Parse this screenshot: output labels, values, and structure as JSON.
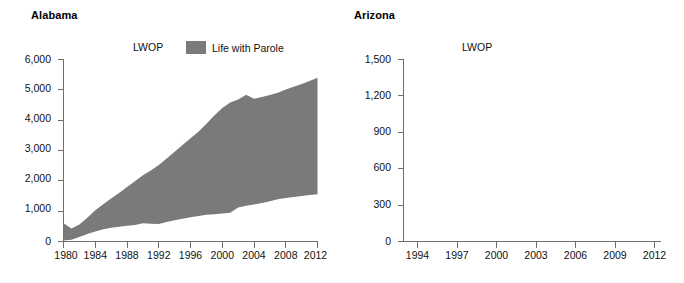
{
  "figure": {
    "background_color": "#ffffff",
    "series_color": "#7a7a7a",
    "axis_color": "#6d6d6d"
  },
  "panels": [
    {
      "id": "alabama",
      "title": "Alabama",
      "inline_label": "LWOP",
      "legend": {
        "swatch_color": "#7a7a7a",
        "label": "Life with Parole"
      }
    },
    {
      "id": "arizona",
      "title": "Arizona",
      "inline_label": "LWOP",
      "legend": null
    }
  ],
  "chart_data": [
    {
      "type": "area",
      "panel": "Alabama",
      "title": "Alabama",
      "xlabel": "",
      "ylabel": "",
      "xlim": [
        1980,
        2012
      ],
      "ylim": [
        0,
        6000
      ],
      "grid": false,
      "legend_position": "top-center",
      "annotations": [
        "LWOP"
      ],
      "ytick_labels": [
        "0",
        "1,000",
        "2,000",
        "3,000",
        "4,000",
        "5,000",
        "6,000"
      ],
      "ytick_values": [
        0,
        1000,
        2000,
        3000,
        4000,
        5000,
        6000
      ],
      "xtick_labels": [
        "1980",
        "1984",
        "1988",
        "1992",
        "1996",
        "2000",
        "2004",
        "2008",
        "2012"
      ],
      "xtick_values": [
        1980,
        1984,
        1988,
        1992,
        1996,
        2000,
        2004,
        2008,
        2012
      ],
      "x": [
        1980,
        1981,
        1982,
        1983,
        1984,
        1985,
        1986,
        1987,
        1988,
        1989,
        1990,
        1991,
        1992,
        1993,
        1994,
        1995,
        1996,
        1997,
        1998,
        1999,
        2000,
        2001,
        2002,
        2003,
        2004,
        2005,
        2006,
        2007,
        2008,
        2009,
        2010,
        2011,
        2012
      ],
      "series": [
        {
          "name": "LWOP",
          "role": "lower_boundary",
          "values": [
            30,
            60,
            150,
            250,
            330,
            400,
            450,
            490,
            520,
            545,
            600,
            585,
            580,
            640,
            700,
            750,
            800,
            840,
            880,
            900,
            920,
            945,
            1120,
            1180,
            1220,
            1270,
            1330,
            1390,
            1430,
            1470,
            1500,
            1530,
            1560
          ]
        },
        {
          "name": "Life with Parole",
          "role": "upper_boundary",
          "values": [
            600,
            430,
            560,
            780,
            1030,
            1230,
            1420,
            1600,
            1800,
            1990,
            2180,
            2340,
            2520,
            2740,
            2960,
            3180,
            3400,
            3620,
            3880,
            4150,
            4400,
            4580,
            4680,
            4840,
            4710,
            4760,
            4830,
            4900,
            5010,
            5100,
            5190,
            5290,
            5400
          ]
        }
      ],
      "notes": "Stacked band: lower boundary is LWOP count, upper boundary is cumulative total including Life with Parole."
    },
    {
      "type": "area",
      "panel": "Arizona",
      "title": "Arizona",
      "xlabel": "",
      "ylabel": "",
      "xlim": [
        1993,
        2012
      ],
      "ylim": [
        0,
        1500
      ],
      "grid": false,
      "legend_position": "top-center",
      "annotations": [
        "LWOP"
      ],
      "ytick_labels": [
        "0",
        "300",
        "600",
        "900",
        "1,200",
        "1,500"
      ],
      "ytick_values": [
        0,
        300,
        600,
        900,
        1200,
        1500
      ],
      "xtick_labels": [
        "1994",
        "1997",
        "2000",
        "2003",
        "2006",
        "2009",
        "2012"
      ],
      "xtick_values": [
        1994,
        1997,
        2000,
        2003,
        2006,
        2009,
        2012
      ],
      "x": [],
      "series": [],
      "notes": "No data band rendered in this panel."
    }
  ]
}
